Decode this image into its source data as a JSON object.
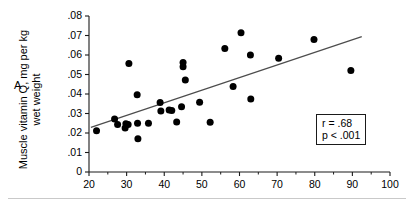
{
  "figure": {
    "panel_label": "A",
    "y_axis_title_line1": "Muscle vitamin Q, mg per kg",
    "y_axis_title_line2": "wet weight",
    "stat_r": "r = .68",
    "stat_p": "p < .001"
  },
  "chart_data": {
    "type": "scatter",
    "title": "",
    "xlabel": "",
    "ylabel": "Muscle vitamin Q, mg per kg wet weight",
    "xlim": [
      20,
      100
    ],
    "ylim": [
      0,
      0.08
    ],
    "grid": false,
    "legend": "none",
    "x_ticks": [
      20,
      30,
      40,
      50,
      60,
      70,
      80,
      90,
      100
    ],
    "x_tick_labels": [
      "20",
      "30",
      "40",
      "50",
      "60",
      "70",
      "80",
      "90",
      "100"
    ],
    "x_minor_ticks": [
      25,
      35,
      45,
      55,
      65,
      75,
      85,
      95
    ],
    "y_ticks": [
      0,
      0.01,
      0.02,
      0.03,
      0.04,
      0.05,
      0.06,
      0.07,
      0.08
    ],
    "y_tick_labels": [
      "0",
      ".01",
      ".02",
      ".03",
      ".04",
      ".05",
      ".06",
      ".07",
      ".08"
    ],
    "marker": "filled-circle",
    "marker_color": "#000000",
    "marker_size_px": 7,
    "points": [
      {
        "x": 22.0,
        "y": 0.0212
      },
      {
        "x": 26.8,
        "y": 0.0272
      },
      {
        "x": 27.6,
        "y": 0.0243
      },
      {
        "x": 29.6,
        "y": 0.0226
      },
      {
        "x": 29.8,
        "y": 0.0248
      },
      {
        "x": 30.6,
        "y": 0.0556
      },
      {
        "x": 30.4,
        "y": 0.0244
      },
      {
        "x": 32.8,
        "y": 0.0396
      },
      {
        "x": 32.9,
        "y": 0.025
      },
      {
        "x": 33.0,
        "y": 0.017
      },
      {
        "x": 35.8,
        "y": 0.025
      },
      {
        "x": 38.9,
        "y": 0.0357
      },
      {
        "x": 39.1,
        "y": 0.0313
      },
      {
        "x": 41.3,
        "y": 0.0318
      },
      {
        "x": 42.0,
        "y": 0.0316
      },
      {
        "x": 43.3,
        "y": 0.0256
      },
      {
        "x": 44.6,
        "y": 0.0334
      },
      {
        "x": 45.0,
        "y": 0.0562
      },
      {
        "x": 45.0,
        "y": 0.054
      },
      {
        "x": 45.6,
        "y": 0.0472
      },
      {
        "x": 49.4,
        "y": 0.0358
      },
      {
        "x": 52.2,
        "y": 0.0255
      },
      {
        "x": 56.1,
        "y": 0.0633
      },
      {
        "x": 58.3,
        "y": 0.0439
      },
      {
        "x": 60.4,
        "y": 0.0714
      },
      {
        "x": 62.9,
        "y": 0.06
      },
      {
        "x": 63.0,
        "y": 0.0374
      },
      {
        "x": 70.4,
        "y": 0.0583
      },
      {
        "x": 79.8,
        "y": 0.068
      },
      {
        "x": 89.6,
        "y": 0.052
      }
    ],
    "trendline": {
      "type": "linear-fit",
      "x_start": 20.5,
      "y_start": 0.0229,
      "x_end": 92.5,
      "y_end": 0.0694,
      "color": "#4d4d4d"
    },
    "annotations": [
      {
        "name": "correlation",
        "text": "r = .68"
      },
      {
        "name": "p-value",
        "text": "p < .001"
      }
    ]
  }
}
